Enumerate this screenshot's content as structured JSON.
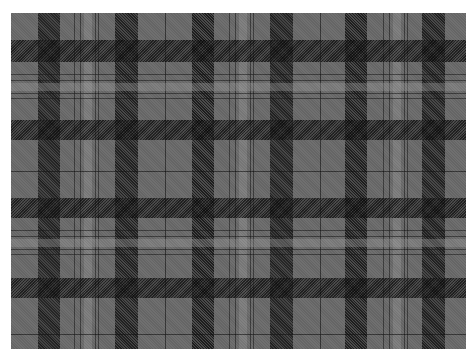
{
  "image": {
    "subject": "grey and black tartan plaid fabric",
    "colors": {
      "base_grey": "#6b6b6b",
      "dark_band": "#3a3a3a",
      "intersection": "#151515",
      "light_line": "#a0a0a0",
      "background": "#ffffff"
    },
    "bounds": {
      "left": 11,
      "top": 13,
      "width": 455,
      "height": 336
    }
  },
  "sett": {
    "vertical": {
      "dark_bands": [
        [
          27,
          22
        ],
        [
          104,
          23
        ],
        [
          181,
          22
        ],
        [
          259,
          23
        ],
        [
          334,
          22
        ],
        [
          411,
          23
        ]
      ],
      "pin_lines": [
        63,
        69,
        84,
        87,
        218,
        224,
        239,
        242,
        372,
        378,
        393,
        396
      ],
      "light_bands": [
        [
          73,
          8
        ],
        [
          228,
          8
        ],
        [
          382,
          8
        ]
      ],
      "thin_lines": [
        154,
        309
      ]
    },
    "horizontal": {
      "dark_bands": [
        [
          27,
          22
        ],
        [
          107,
          20
        ],
        [
          185,
          20
        ],
        [
          265,
          20
        ]
      ],
      "pin_lines": [
        61,
        67,
        80,
        85,
        217,
        223,
        236,
        241
      ],
      "light_bands": [
        [
          70,
          8
        ],
        [
          226,
          8
        ]
      ],
      "thin_lines": [
        158,
        321
      ]
    }
  }
}
